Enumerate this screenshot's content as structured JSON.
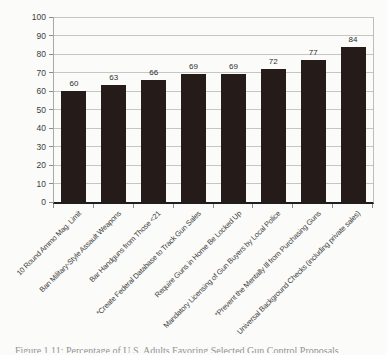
{
  "chart_data": {
    "type": "bar",
    "title": "",
    "xlabel": "",
    "ylabel": "",
    "categories": [
      "10 Round Ammo Mag. Limit",
      "Ban Military-Style Assault Weapons",
      "Bar Handguns from Those <21",
      "*Create Federal Database to Track Gun Sales",
      "Require Guns in Home Be Locked Up",
      "Mandatory Licensing of Gun Buyers by Local Police",
      "*Prevent the Mentally Ill from Purchasing Guns",
      "Universal Background Checks (including private sales)"
    ],
    "values": [
      60,
      63,
      66,
      69,
      69,
      72,
      77,
      84
    ],
    "value_labels": [
      "60",
      "63",
      "66",
      "69",
      "69",
      "72",
      "77",
      "84"
    ],
    "ylim": [
      0,
      100
    ],
    "yticks": [
      0,
      10,
      20,
      30,
      40,
      50,
      60,
      70,
      80,
      90,
      100
    ],
    "grid": true,
    "legend": "none",
    "bar_color": "#251c19",
    "grid_color": "#c6c6c6"
  },
  "caption": {
    "text": "Figure 1.11: Percentage of U.S. Adults Favoring Selected Gun Control Proposals"
  }
}
